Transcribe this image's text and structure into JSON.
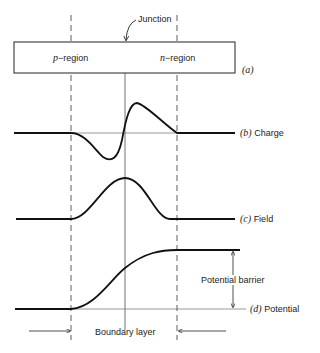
{
  "diagram": {
    "junction_label": "Junction",
    "p_region_prefix": "p",
    "p_region_label": "−region",
    "n_region_prefix": "n",
    "n_region_label": "−region",
    "panels": [
      {
        "tag": "(a)",
        "label": ""
      },
      {
        "tag": "(b)",
        "label": "Charge"
      },
      {
        "tag": "(c)",
        "label": "Field"
      },
      {
        "tag": "(d)",
        "label": "Potential"
      }
    ],
    "potential_barrier_label": "Potential barrier",
    "boundary_layer_label": "Boundary layer"
  }
}
